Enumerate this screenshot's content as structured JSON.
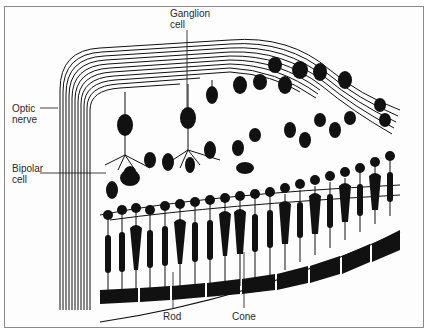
{
  "figure": {
    "labels": {
      "ganglion_cell": "Ganglion\ncell",
      "optic_nerve": "Optic\nnerve",
      "bipolar_cell": "Bipolar\ncell",
      "rod": "Rod",
      "cone": "Cone"
    },
    "colors": {
      "ink": "#111111",
      "label_text": "#2a2a2a",
      "frame": "#8a8a8a",
      "background": "#ffffff"
    }
  }
}
